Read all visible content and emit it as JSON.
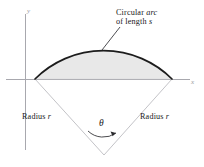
{
  "figure": {
    "background_color": "#ffffff",
    "axes": {
      "x_label": "x",
      "y_label": "y",
      "axis_color": "#9a9aa0",
      "origin_px": [
        35,
        79
      ]
    },
    "annotations": {
      "arc_label_line1": "Circular ",
      "arc_label_line1_italic": "arc",
      "arc_label_line2_prefix": "of length ",
      "arc_label_line2_italic": "s",
      "radius_left_prefix": "Radius ",
      "radius_left_italic": "r",
      "radius_right_prefix": "Radius ",
      "radius_right_italic": "r",
      "angle_symbol": "θ"
    },
    "geometry": {
      "apex_px": [
        104,
        155
      ],
      "left_vertex_px": [
        35,
        79
      ],
      "right_vertex_px": [
        172,
        79
      ],
      "arc_apex_px": [
        104,
        52
      ],
      "radius_px": 97,
      "sector_fill": "#e9e9e9",
      "arc_stroke": "#1a1a1a",
      "radius_stroke": "#b9b9bd",
      "leader_stroke": "#3c3c40"
    }
  }
}
